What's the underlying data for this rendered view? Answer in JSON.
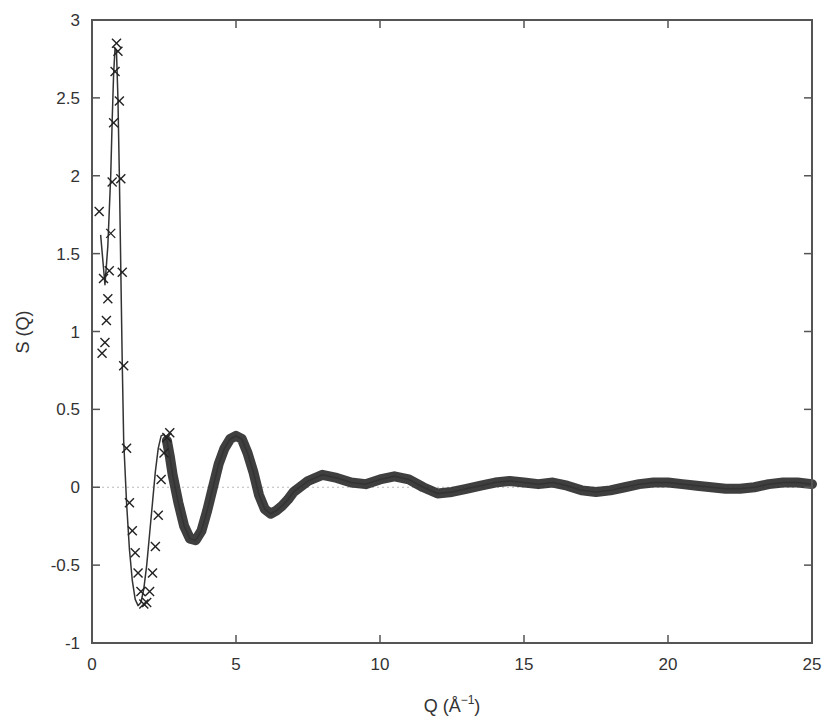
{
  "chart_data": {
    "type": "line",
    "title": "",
    "xlabel": "Q (Å⁻¹)",
    "xlabel_main": "Q (Å",
    "xlabel_sup": "−1",
    "xlabel_close": ")",
    "ylabel": "S (Q)",
    "xlim": [
      0,
      25
    ],
    "ylim": [
      -1,
      3
    ],
    "grid": false,
    "legend": null,
    "zero_line": {
      "y": 0,
      "style": "dotted",
      "color": "#bbbbbb"
    },
    "x_ticks": [
      0,
      5,
      10,
      15,
      20,
      25
    ],
    "x_tick_labels": [
      "0",
      "5",
      "10",
      "15",
      "20",
      "25"
    ],
    "y_ticks": [
      -1,
      -0.5,
      0,
      0.5,
      1,
      1.5,
      2,
      2.5,
      3
    ],
    "y_tick_labels": [
      "-1",
      "-0.5",
      "0",
      "0.5",
      "1",
      "1.5",
      "2",
      "2.5",
      "3"
    ],
    "series": [
      {
        "name": "model (solid line)",
        "style": "line",
        "color": "#333333",
        "x": [
          0.3,
          0.45,
          0.55,
          0.65,
          0.7,
          0.75,
          0.8,
          0.85,
          0.9,
          0.95,
          1.0,
          1.05,
          1.1,
          1.2,
          1.3,
          1.4,
          1.5,
          1.6,
          1.7,
          1.8,
          1.9,
          2.0,
          2.1,
          2.2,
          2.3,
          2.4,
          2.5,
          2.6,
          2.7,
          2.8,
          3.0,
          3.2,
          3.4,
          3.6,
          3.8,
          4.0,
          4.2,
          4.4,
          4.6,
          4.8,
          5.0,
          5.2,
          5.4,
          5.6,
          5.8,
          6.0,
          6.2,
          6.4,
          6.6,
          6.8,
          7.0,
          7.5,
          8.0,
          8.5,
          9.0,
          9.5,
          10.0,
          10.5,
          11.0,
          11.5,
          12.0,
          12.5,
          13.0,
          13.5,
          14.0,
          14.5,
          15.0,
          15.5,
          16.0,
          16.5,
          17.0,
          17.5,
          18.0,
          18.5,
          19.0,
          19.5,
          20.0,
          20.5,
          21.0,
          21.5,
          22.0,
          22.5,
          23.0,
          23.5,
          24.0,
          24.5,
          25.0
        ],
        "y": [
          1.62,
          1.3,
          1.55,
          2.0,
          2.35,
          2.65,
          2.82,
          2.8,
          2.5,
          2.0,
          1.4,
          0.8,
          0.3,
          -0.1,
          -0.4,
          -0.6,
          -0.72,
          -0.76,
          -0.74,
          -0.65,
          -0.5,
          -0.3,
          -0.1,
          0.1,
          0.25,
          0.33,
          0.34,
          0.3,
          0.2,
          0.08,
          -0.1,
          -0.25,
          -0.33,
          -0.34,
          -0.28,
          -0.15,
          0.0,
          0.15,
          0.25,
          0.31,
          0.33,
          0.31,
          0.22,
          0.1,
          -0.05,
          -0.14,
          -0.17,
          -0.15,
          -0.12,
          -0.08,
          -0.03,
          0.04,
          0.08,
          0.06,
          0.03,
          0.02,
          0.05,
          0.07,
          0.05,
          0.0,
          -0.04,
          -0.03,
          -0.01,
          0.01,
          0.03,
          0.04,
          0.03,
          0.02,
          0.03,
          0.01,
          -0.02,
          -0.03,
          -0.02,
          0.0,
          0.02,
          0.03,
          0.03,
          0.02,
          0.01,
          0.0,
          -0.01,
          -0.01,
          0.0,
          0.02,
          0.03,
          0.03,
          0.02
        ]
      },
      {
        "name": "experiment (x markers)",
        "style": "markers",
        "marker": "x",
        "color": "#222222",
        "x": [
          0.25,
          0.35,
          0.4,
          0.45,
          0.5,
          0.55,
          0.6,
          0.65,
          0.7,
          0.75,
          0.8,
          0.85,
          0.9,
          0.95,
          1.0,
          1.05,
          1.1,
          1.2,
          1.3,
          1.4,
          1.5,
          1.6,
          1.7,
          1.8,
          1.9,
          2.0,
          2.1,
          2.2,
          2.3,
          2.4,
          2.5,
          2.6,
          2.7
        ],
        "y": [
          1.77,
          0.86,
          1.34,
          0.93,
          1.07,
          1.21,
          1.39,
          1.63,
          1.96,
          2.34,
          2.67,
          2.85,
          2.8,
          2.48,
          1.98,
          1.38,
          0.78,
          0.25,
          -0.1,
          -0.28,
          -0.42,
          -0.55,
          -0.67,
          -0.75,
          -0.74,
          -0.67,
          -0.55,
          -0.38,
          -0.18,
          0.05,
          0.22,
          0.32,
          0.35
        ]
      }
    ]
  }
}
